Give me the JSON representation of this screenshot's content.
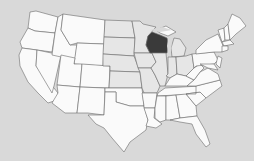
{
  "map": {
    "title": "United States map",
    "highlighted_state": "Wisconsin",
    "colors": {
      "background": "#d9d9d9",
      "state_fill": "#fafafa",
      "midwest_fill": "#e6e6e6",
      "highlight_fill": "#3a3a3a",
      "border": "#6a6a6a"
    }
  }
}
